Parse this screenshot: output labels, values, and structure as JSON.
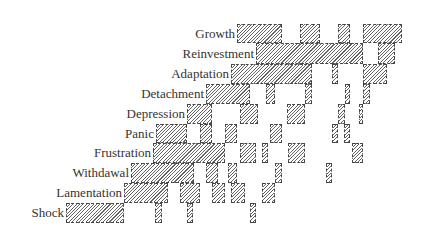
{
  "chart_data": {
    "type": "bar",
    "subtype": "gantt-like stage timeline (hatched bars)",
    "title": "",
    "xlabel": "",
    "ylabel": "",
    "grid": false,
    "legend": null,
    "categories": [
      "Growth",
      "Reinvestment",
      "Adaptation",
      "Detachment",
      "Depression",
      "Panic",
      "Frustration",
      "Withdawal",
      "Lamentation",
      "Shock"
    ],
    "rows": [
      {
        "label": "Growth",
        "y": 24,
        "h": 19,
        "label_right": 235,
        "bars": [
          [
            237,
            282
          ],
          [
            300,
            320
          ],
          [
            338,
            350
          ],
          [
            363,
            402
          ]
        ]
      },
      {
        "label": "Reinvestment",
        "y": 43,
        "h": 21,
        "label_right": 254,
        "bars": [
          [
            256,
            363
          ],
          [
            378,
            395
          ]
        ]
      },
      {
        "label": "Adaptation",
        "y": 64,
        "h": 20,
        "label_right": 229,
        "bars": [
          [
            231,
            312
          ],
          [
            332,
            338
          ],
          [
            363,
            387
          ]
        ]
      },
      {
        "label": "Detachment",
        "y": 84,
        "h": 20,
        "label_right": 204,
        "bars": [
          [
            206,
            250
          ],
          [
            266,
            275
          ],
          [
            305,
            312
          ],
          [
            345,
            350
          ],
          [
            363,
            370
          ]
        ]
      },
      {
        "label": "Depression",
        "y": 104,
        "h": 20,
        "label_right": 185,
        "bars": [
          [
            187,
            212
          ],
          [
            240,
            258
          ],
          [
            287,
            305
          ],
          [
            338,
            345
          ],
          [
            359,
            363
          ]
        ]
      },
      {
        "label": "Panic",
        "y": 124,
        "h": 19,
        "label_right": 154,
        "bars": [
          [
            156,
            187
          ],
          [
            200,
            212
          ],
          [
            225,
            237
          ],
          [
            270,
            282
          ],
          [
            332,
            338
          ],
          [
            344,
            350
          ]
        ]
      },
      {
        "label": "Frustration",
        "y": 143,
        "h": 20,
        "label_right": 151,
        "bars": [
          [
            153,
            225
          ],
          [
            240,
            256
          ],
          [
            262,
            268
          ],
          [
            288,
            305
          ],
          [
            352,
            363
          ]
        ]
      },
      {
        "label": "Withdawal",
        "y": 163,
        "h": 20,
        "label_right": 129,
        "bars": [
          [
            131,
            194
          ],
          [
            206,
            218
          ],
          [
            228,
            237
          ],
          [
            275,
            282
          ],
          [
            326,
            332
          ]
        ]
      },
      {
        "label": "Lamentation",
        "y": 183,
        "h": 20,
        "label_right": 122,
        "bars": [
          [
            124,
            168
          ],
          [
            180,
            200
          ],
          [
            212,
            225
          ],
          [
            231,
            245
          ],
          [
            262,
            275
          ]
        ]
      },
      {
        "label": "Shock",
        "y": 203,
        "h": 20,
        "label_right": 64,
        "bars": [
          [
            66,
            124
          ],
          [
            155,
            162
          ],
          [
            187,
            193
          ],
          [
            250,
            256
          ]
        ]
      }
    ]
  }
}
